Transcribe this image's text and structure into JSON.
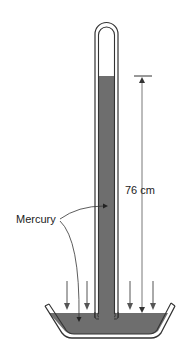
{
  "diagram": {
    "labels": {
      "mercury": "Mercury",
      "column_height": "76 cm"
    },
    "colors": {
      "mercury_fill": "#6e6e6e",
      "outline": "#333333",
      "arrow": "#555555",
      "background": "#ffffff"
    },
    "elements": {
      "tube": "closed glass tube inverted in dish",
      "vacuum": "empty space at top of tube",
      "dish": "open dish of mercury",
      "pressure_arrows": 4,
      "measurement": "76 cm from dish surface to mercury column top"
    }
  }
}
